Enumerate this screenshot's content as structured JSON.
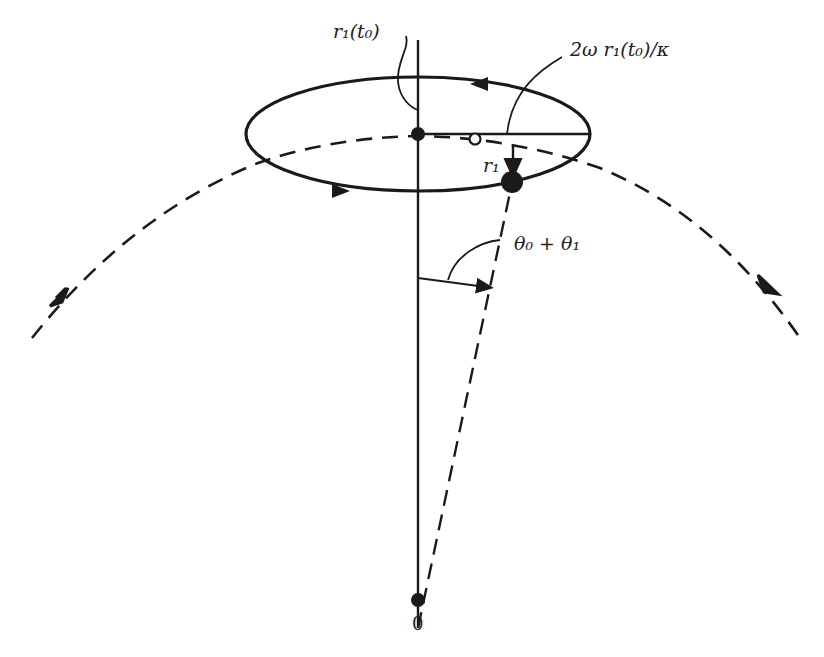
{
  "diagram": {
    "type": "orbital-perturbation",
    "labels": {
      "r1_t0": "r₁(t₀)",
      "ellipse_axis": "2ω r₁(t₀)/κ",
      "r1": "r₁",
      "angle": "θ₀ + θ₁",
      "origin": "0"
    },
    "colors": {
      "ink": "#1a1a1a",
      "background": "#ffffff"
    },
    "elements": [
      "ellipse-epicycle",
      "dashed-circular-orbit",
      "vertical-reference-line",
      "dashed-radius-line",
      "angle-arc",
      "guiding-center-dot",
      "particle-dot",
      "open-circle-marker",
      "origin-dot"
    ]
  }
}
